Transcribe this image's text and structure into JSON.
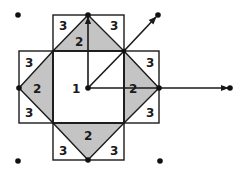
{
  "diagram": {
    "colors": {
      "ink": "#1a1a1a",
      "shade": "#c4c4c4",
      "background": "#ffffff"
    },
    "center": {
      "label": "1"
    },
    "regions": {
      "top": {
        "left_label": "3",
        "right_label": "3",
        "triangle_label": "2"
      },
      "left": {
        "top_label": "3",
        "bottom_label": "3",
        "triangle_label": "2"
      },
      "right": {
        "top_label": "3",
        "bottom_label": "3",
        "triangle_label": "2"
      },
      "bottom": {
        "left_label": "3",
        "right_label": "3",
        "triangle_label": "2"
      }
    },
    "arrows": [
      {
        "name": "vertical-up",
        "from": "center",
        "to": "top"
      },
      {
        "name": "diagonal-up-right",
        "from": "top-right-corner",
        "to": "upper-right-point"
      },
      {
        "name": "horizontal-right",
        "from": "right",
        "to": "far-right-point"
      }
    ],
    "corner_points": [
      "top-left",
      "bottom-left",
      "bottom-right"
    ]
  }
}
